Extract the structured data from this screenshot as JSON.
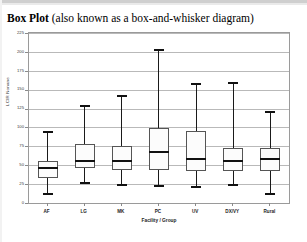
{
  "document": {
    "title_strong": "Box Plot",
    "title_rest": " (also known as a box-and-whisker diagram)"
  },
  "chart_data": {
    "type": "box",
    "title": "",
    "xlabel": "Facility / Group",
    "ylabel": "LCIR Nonane",
    "categories": [
      "AF",
      "LG",
      "MK",
      "PC",
      "UV",
      "DX/VY",
      "Rural"
    ],
    "ylim": [
      0,
      225
    ],
    "yticks": [
      0,
      25,
      50,
      75,
      100,
      125,
      150,
      175,
      200,
      225
    ],
    "ytick_labels": [
      "0",
      "25",
      "50",
      "75",
      "100",
      "125",
      "150",
      "175",
      "200",
      "225"
    ],
    "grid": true,
    "legend": "none",
    "boxes": [
      {
        "category": "AF",
        "min": 12,
        "q1": 33,
        "median": 46,
        "q3": 56,
        "max": 94
      },
      {
        "category": "LG",
        "min": 26,
        "q1": 46,
        "median": 55,
        "q3": 78,
        "max": 128
      },
      {
        "category": "MK",
        "min": 24,
        "q1": 44,
        "median": 56,
        "q3": 76,
        "max": 141
      },
      {
        "category": "PC",
        "min": 22,
        "q1": 43,
        "median": 67,
        "q3": 99,
        "max": 203
      },
      {
        "category": "UV",
        "min": 21,
        "q1": 43,
        "median": 58,
        "q3": 95,
        "max": 158
      },
      {
        "category": "DX/VY",
        "min": 24,
        "q1": 42,
        "median": 56,
        "q3": 73,
        "max": 159
      },
      {
        "category": "Rural",
        "min": 12,
        "q1": 42,
        "median": 58,
        "q3": 73,
        "max": 121
      }
    ]
  },
  "style": {
    "box_fill": "#fcfcfc",
    "box_stroke": "#555555",
    "whisker_color": "#1a1a1a",
    "grid_color": "#b9b9b9",
    "frame_color": "#9a9a9a"
  }
}
